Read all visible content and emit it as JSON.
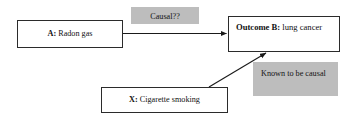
{
  "diagram": {
    "type": "causal-diagram",
    "title": "",
    "background_color": "#ffffff",
    "annotation_fill_color": "#bdbdbd",
    "box_border_color": "#2b2b2b",
    "text_color": "#111111",
    "nodes": [
      {
        "id": "a",
        "key": "A:",
        "text": " Radon gas",
        "role": "exposure"
      },
      {
        "id": "b",
        "key": "Outcome B:",
        "text": " lung cancer",
        "role": "outcome"
      },
      {
        "id": "x",
        "key": "X:",
        "text": " Cigarette smoking",
        "role": "confounder"
      }
    ],
    "annotations": [
      {
        "id": "causal",
        "text": "Causal??",
        "edge": "a-to-b"
      },
      {
        "id": "known",
        "text": "Known to be causal",
        "edge": "x-to-b"
      }
    ],
    "edges": [
      {
        "id": "a-to-b",
        "from": "a",
        "to": "b",
        "style": "straight-arrow",
        "label": "Causal??"
      },
      {
        "id": "x-to-b",
        "from": "x",
        "to": "b",
        "style": "diagonal-arrow",
        "label": "Known to be causal"
      }
    ]
  }
}
